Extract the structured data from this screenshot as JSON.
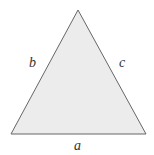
{
  "diagram": {
    "type": "triangle",
    "fill": "#ececec",
    "stroke": "#666666",
    "vertices": {
      "apex": [
        78,
        10
      ],
      "bottom_left": [
        11,
        134
      ],
      "bottom_right": [
        146,
        134
      ]
    },
    "side_labels": {
      "a": "a",
      "b": "b",
      "c": "c"
    }
  }
}
